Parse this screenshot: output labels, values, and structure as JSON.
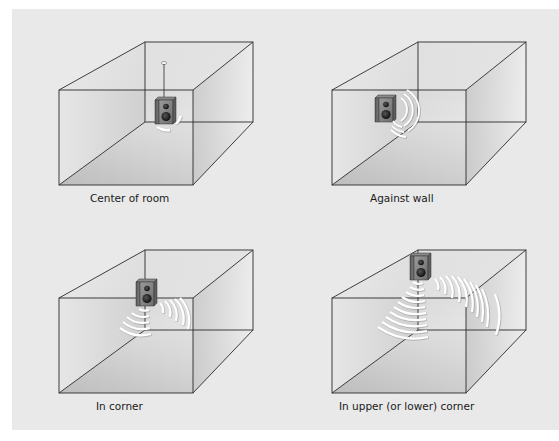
{
  "figure": {
    "background_color": "#e9e9e9",
    "panels": [
      {
        "id": "center",
        "label": "Center of room",
        "speaker_position": "center of room, suspended from ceiling",
        "wave_arcs": 2
      },
      {
        "id": "wall",
        "label": "Against wall",
        "speaker_position": "against back-left wall",
        "wave_arcs": 3
      },
      {
        "id": "corner",
        "label": "In corner",
        "speaker_position": "in vertical corner",
        "wave_arcs": 10
      },
      {
        "id": "upper-corner",
        "label": "In upper (or lower) corner",
        "speaker_position": "in upper back corner",
        "wave_arcs": 18
      }
    ]
  }
}
